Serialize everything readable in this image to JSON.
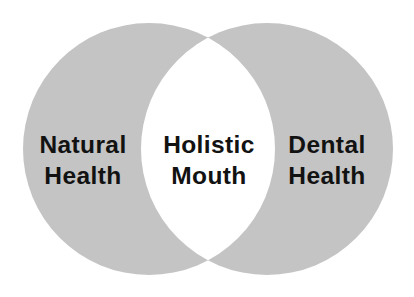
{
  "diagram": {
    "type": "venn",
    "colors": {
      "background": "#ffffff",
      "circle_fill": "#c4c4c4",
      "intersection_fill": "#ffffff",
      "text": "#121212"
    },
    "sets": [
      {
        "id": "left",
        "label_line1": "Natural",
        "label_line2": "Health"
      },
      {
        "id": "right",
        "label_line1": "Dental",
        "label_line2": "Health"
      }
    ],
    "intersection": {
      "label_line1": "Holistic",
      "label_line2": "Mouth"
    }
  }
}
